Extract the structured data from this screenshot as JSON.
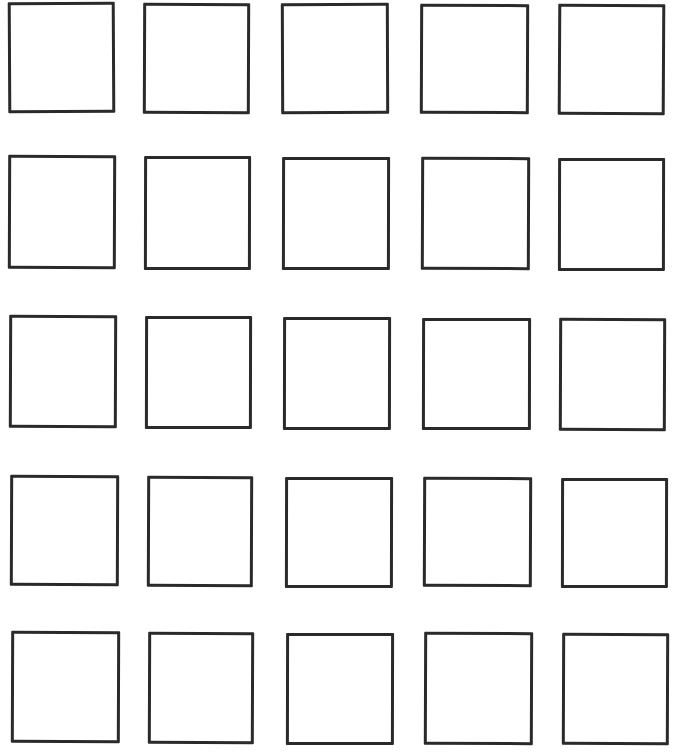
{
  "diagram": {
    "type": "grid-of-empty-boxes",
    "rows": 5,
    "columns": 5,
    "stroke_color": "#2a2a2a",
    "background_color": "#ffffff",
    "boxes": [
      {
        "row": 1,
        "col": 1,
        "x": 8,
        "y": 2,
        "w": 107,
        "h": 111,
        "rot": -0.3
      },
      {
        "row": 1,
        "col": 2,
        "x": 143,
        "y": 3,
        "w": 107,
        "h": 111,
        "rot": 0.2
      },
      {
        "row": 1,
        "col": 3,
        "x": 281,
        "y": 3,
        "w": 108,
        "h": 111,
        "rot": -0.2
      },
      {
        "row": 1,
        "col": 4,
        "x": 420,
        "y": 4,
        "w": 109,
        "h": 110,
        "rot": 0.2
      },
      {
        "row": 1,
        "col": 5,
        "x": 558,
        "y": 4,
        "w": 107,
        "h": 111,
        "rot": 0.3
      },
      {
        "row": 2,
        "col": 1,
        "x": 8,
        "y": 155,
        "w": 108,
        "h": 114,
        "rot": 0.2
      },
      {
        "row": 2,
        "col": 2,
        "x": 144,
        "y": 156,
        "w": 107,
        "h": 114,
        "rot": 0.1
      },
      {
        "row": 2,
        "col": 3,
        "x": 282,
        "y": 157,
        "w": 108,
        "h": 113,
        "rot": 0.1
      },
      {
        "row": 2,
        "col": 4,
        "x": 421,
        "y": 157,
        "w": 109,
        "h": 113,
        "rot": 0.2
      },
      {
        "row": 2,
        "col": 5,
        "x": 558,
        "y": 158,
        "w": 107,
        "h": 113,
        "rot": 0.1
      },
      {
        "row": 3,
        "col": 1,
        "x": 9,
        "y": 315,
        "w": 108,
        "h": 113,
        "rot": 0.2
      },
      {
        "row": 3,
        "col": 2,
        "x": 145,
        "y": 316,
        "w": 107,
        "h": 113,
        "rot": 0.1
      },
      {
        "row": 3,
        "col": 3,
        "x": 283,
        "y": 317,
        "w": 108,
        "h": 113,
        "rot": 0.1
      },
      {
        "row": 3,
        "col": 4,
        "x": 422,
        "y": 318,
        "w": 109,
        "h": 112,
        "rot": 0.1
      },
      {
        "row": 3,
        "col": 5,
        "x": 559,
        "y": 318,
        "w": 107,
        "h": 113,
        "rot": 0.2
      },
      {
        "row": 4,
        "col": 1,
        "x": 10,
        "y": 475,
        "w": 109,
        "h": 111,
        "rot": 0.2
      },
      {
        "row": 4,
        "col": 2,
        "x": 147,
        "y": 476,
        "w": 106,
        "h": 111,
        "rot": 0.2
      },
      {
        "row": 4,
        "col": 3,
        "x": 285,
        "y": 477,
        "w": 108,
        "h": 111,
        "rot": 0.1
      },
      {
        "row": 4,
        "col": 4,
        "x": 423,
        "y": 477,
        "w": 109,
        "h": 110,
        "rot": 0.2
      },
      {
        "row": 4,
        "col": 5,
        "x": 561,
        "y": 478,
        "w": 107,
        "h": 110,
        "rot": 0.1
      },
      {
        "row": 5,
        "col": 1,
        "x": 11,
        "y": 631,
        "w": 109,
        "h": 112,
        "rot": 0.2
      },
      {
        "row": 5,
        "col": 2,
        "x": 148,
        "y": 632,
        "w": 106,
        "h": 112,
        "rot": 0.2
      },
      {
        "row": 5,
        "col": 3,
        "x": 286,
        "y": 633,
        "w": 108,
        "h": 112,
        "rot": 0.1
      },
      {
        "row": 5,
        "col": 4,
        "x": 424,
        "y": 632,
        "w": 109,
        "h": 113,
        "rot": 0.2
      },
      {
        "row": 5,
        "col": 5,
        "x": 562,
        "y": 633,
        "w": 107,
        "h": 112,
        "rot": 0.2
      }
    ]
  }
}
